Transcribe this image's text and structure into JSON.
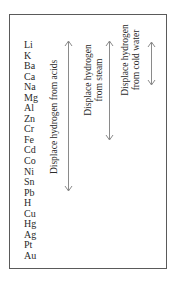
{
  "diagram": {
    "elements": [
      "Li",
      "K",
      "Ba",
      "Ca",
      "Na",
      "Mg",
      "Al",
      "Zn",
      "Cr",
      "Fe",
      "Cd",
      "Co",
      "Ni",
      "Sn",
      "Pb",
      "H",
      "Cu",
      "Hg",
      "Ag",
      "Pt",
      "Au"
    ],
    "labels": {
      "acids": "Displace hydrogen from acids",
      "steam_line1": "Displace hydrogen",
      "steam_line2": "from steam",
      "cold_water_line1": "Displace hydrogen",
      "cold_water_line2": "from cold water"
    },
    "arrows": [
      {
        "name": "acids",
        "range": "Li to Pb"
      },
      {
        "name": "steam",
        "range": "Li to Fe"
      },
      {
        "name": "cold_water",
        "range": "Li to Na"
      }
    ],
    "colors": {
      "text": "#2a2a2a",
      "border": "#5a5a5a",
      "arrow": "#8a8a8a"
    }
  }
}
